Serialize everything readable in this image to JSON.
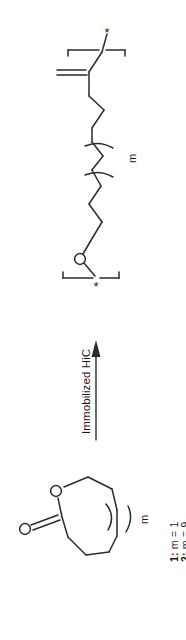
{
  "figure": {
    "kind": "chemical-reaction-scheme",
    "orientation": "rotated-90-clockwise",
    "background_color": "#ffffff",
    "line_color": "#2b2b2b",
    "text_color": "#1a1a1a"
  },
  "product": {
    "name": "polyester-repeat-unit",
    "description": "Polyester repeat unit drawn between two polymer brackets, each capped with an asterisk attachment point.",
    "carbonyl_oxygen_label": "O",
    "ester_oxygen_label": "O",
    "left_bracket_star": "*",
    "right_bracket_star": "*",
    "repeat_subscript": "m"
  },
  "arrow": {
    "name": "reaction-arrow",
    "direction": "up",
    "label": "Immobilized HiC"
  },
  "reactant": {
    "name": "lactone-ring",
    "description": "Seven-membered lactone ring (caprolactone-type) with a ring-expansion bracket labelled m.",
    "carbonyl_oxygen_label": "O",
    "ring_oxygen_label": "O",
    "repeat_subscript": "m"
  },
  "legend": {
    "name": "compound-legend",
    "entries": [
      {
        "id": "1",
        "prefix": "1:",
        "text": "m = 1"
      },
      {
        "id": "2",
        "prefix": "2:",
        "text": "m = 9"
      }
    ]
  }
}
